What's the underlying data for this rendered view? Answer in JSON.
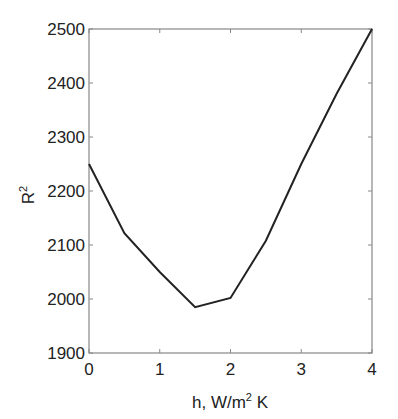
{
  "chart_data": {
    "type": "line",
    "title": "",
    "xlabel": "h, W/m² K",
    "ylabel": "R²",
    "xlim": [
      0,
      4
    ],
    "ylim": [
      1900,
      2500
    ],
    "xticks": [
      0,
      1,
      2,
      3,
      4
    ],
    "yticks": [
      1900,
      2000,
      2100,
      2200,
      2300,
      2400,
      2500
    ],
    "grid": false,
    "legend": null,
    "x": [
      0,
      0.5,
      1,
      1.5,
      2,
      2.5,
      3,
      3.5,
      4
    ],
    "series": [
      {
        "name": "R2",
        "values": [
          2250,
          2122,
          2050,
          1985,
          2002,
          2108,
          2250,
          2380,
          2500
        ]
      }
    ]
  },
  "labels": {
    "xlabel_main": "h, W/m",
    "xlabel_sup": "2",
    "xlabel_tail": " K",
    "ylabel_main": "R",
    "ylabel_sup": "2"
  }
}
